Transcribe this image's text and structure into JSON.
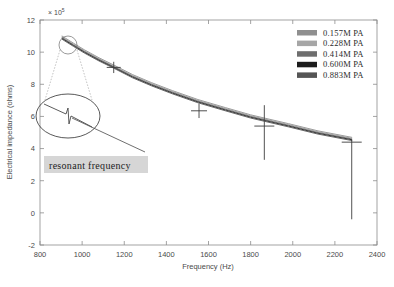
{
  "chart_data": {
    "type": "line",
    "title": "",
    "xlabel": "Frequency (Hz)",
    "ylabel": "Electrical impedance (ohms)",
    "y_exponent_label": "× 10",
    "y_exponent_power": "5",
    "xlim": [
      800,
      2400
    ],
    "ylim": [
      -2,
      12
    ],
    "xticks": [
      800,
      1000,
      1200,
      1400,
      1600,
      1800,
      2000,
      2200,
      2400
    ],
    "yticks": [
      -2,
      0,
      2,
      4,
      6,
      8,
      10,
      12
    ],
    "grid": false,
    "legend_position": "top-right",
    "series": [
      {
        "name": "0.157M PA",
        "color": "#8f8f8f",
        "x": [
          905,
          960,
          1010,
          1080,
          1150,
          1240,
          1330,
          1430,
          1550,
          1680,
          1800,
          1865,
          1980,
          2120,
          2280
        ],
        "y": [
          11.0,
          10.55,
          10.15,
          9.65,
          9.2,
          8.6,
          8.1,
          7.6,
          7.05,
          6.55,
          6.1,
          5.9,
          5.55,
          5.1,
          4.7
        ]
      },
      {
        "name": "0.228M PA",
        "color": "#a6a6a6",
        "x": [
          905,
          960,
          1010,
          1080,
          1150,
          1240,
          1330,
          1430,
          1550,
          1680,
          1800,
          1865,
          1980,
          2120,
          2280
        ],
        "y": [
          10.95,
          10.5,
          10.1,
          9.6,
          9.15,
          8.55,
          8.05,
          7.55,
          7.0,
          6.5,
          6.05,
          5.85,
          5.5,
          5.05,
          4.65
        ]
      },
      {
        "name": "0.414M PA",
        "color": "#6e6e6e",
        "x": [
          905,
          960,
          1010,
          1080,
          1150,
          1240,
          1330,
          1430,
          1550,
          1680,
          1800,
          1865,
          1980,
          2120,
          2280
        ],
        "y": [
          10.9,
          10.45,
          10.05,
          9.55,
          9.1,
          8.5,
          8.0,
          7.5,
          6.95,
          6.45,
          6.0,
          5.8,
          5.45,
          5.0,
          4.6
        ]
      },
      {
        "name": "0.600M PA",
        "color": "#1c1c1c",
        "x": [
          905,
          960,
          1010,
          1080,
          1150,
          1240,
          1330,
          1430,
          1550,
          1680,
          1800,
          1865,
          1980,
          2120,
          2280
        ],
        "y": [
          10.85,
          10.4,
          10.0,
          9.5,
          9.05,
          8.45,
          7.95,
          7.45,
          6.9,
          6.4,
          5.95,
          5.75,
          5.4,
          4.95,
          4.55
        ]
      },
      {
        "name": "0.883M PA",
        "color": "#555555",
        "x": [
          905,
          960,
          1010,
          1080,
          1150,
          1240,
          1330,
          1430,
          1550,
          1680,
          1800,
          1865,
          1980,
          2120,
          2280
        ],
        "y": [
          10.8,
          10.35,
          9.95,
          9.45,
          9.0,
          8.4,
          7.9,
          7.4,
          6.85,
          6.35,
          5.9,
          5.7,
          5.35,
          4.9,
          4.5
        ]
      }
    ],
    "error_bars": [
      {
        "x": 1150,
        "y": 9.05,
        "err_low": 0.35,
        "err_high": 0.35,
        "cap_half_width": 14
      },
      {
        "x": 1555,
        "y": 6.35,
        "err_low": 0.45,
        "err_high": 0.45,
        "cap_half_width": 16
      },
      {
        "x": 1865,
        "y": 5.4,
        "err_low": 2.1,
        "err_high": 1.3,
        "cap_half_width": 20
      },
      {
        "x": 2280,
        "y": 4.4,
        "err_low": 4.8,
        "err_high": 0.15,
        "cap_half_width": 20
      }
    ],
    "annotations": [
      {
        "text": "resonant frequency",
        "x_pixel": 48,
        "y_pixel": 162,
        "background": "#d6d6d6"
      }
    ],
    "magnifier": {
      "source_center_x": 950,
      "source_center_y": 10.2,
      "label": "zoom inset of resonant frequency peak"
    }
  },
  "legend": {
    "items": [
      {
        "label": "0.157M PA",
        "color": "#8f8f8f"
      },
      {
        "label": "0.228M PA",
        "color": "#a6a6a6"
      },
      {
        "label": "0.414M PA",
        "color": "#6e6e6e"
      },
      {
        "label": "0.600M PA",
        "color": "#1c1c1c"
      },
      {
        "label": "0.883M PA",
        "color": "#555555"
      }
    ]
  },
  "axes": {
    "x_title": "Frequency (Hz)",
    "y_title": "Electrical impedance (ohms)",
    "exponent_mantissa": "× 10",
    "exponent_power": "5",
    "x_tick_labels": [
      "800",
      "1000",
      "1200",
      "1400",
      "1600",
      "1800",
      "2000",
      "2200",
      "2400"
    ],
    "y_tick_labels": [
      "12",
      "10",
      "8",
      "6",
      "4",
      "2",
      "0",
      "-2"
    ]
  }
}
